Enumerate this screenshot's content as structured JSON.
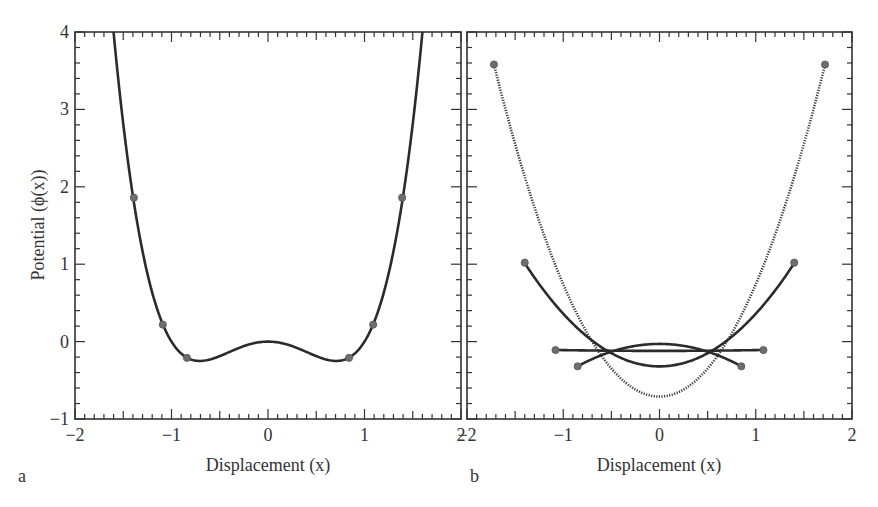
{
  "figure": {
    "panels": [
      {
        "id": "a",
        "label": "a"
      },
      {
        "id": "b",
        "label": "b"
      }
    ],
    "ylabel_text": "Potential (ϕ(x))",
    "xlabel_text": "Displacement (x)"
  },
  "chart_data": [
    {
      "type": "line",
      "panel": "a",
      "title": "",
      "xlabel": "Displacement (x)",
      "ylabel": "Potential (ϕ(x))",
      "xlim": [
        -2,
        2
      ],
      "ylim": [
        -1,
        4
      ],
      "xticks": [
        -2,
        -1,
        0,
        1,
        2
      ],
      "yticks": [
        -1,
        0,
        1,
        2,
        3,
        4
      ],
      "xtick_labels": [
        "−2",
        "−1",
        "0",
        "1",
        "2"
      ],
      "ytick_labels": [
        "−1",
        "0",
        "1",
        "2",
        "3",
        "4"
      ],
      "grid": false,
      "legend": null,
      "series": [
        {
          "name": "phi(x) = x^4 - x^2",
          "function": "x^4 - x^2",
          "x_range": [
            -1.6,
            1.6
          ],
          "style": "solid"
        }
      ],
      "markers": [
        {
          "x": -1.39,
          "y": 1.86
        },
        {
          "x": -1.09,
          "y": 0.22
        },
        {
          "x": -0.84,
          "y": -0.21
        },
        {
          "x": 0.84,
          "y": -0.21
        },
        {
          "x": 1.09,
          "y": 0.22
        },
        {
          "x": 1.39,
          "y": 1.86
        }
      ],
      "key_points": [
        {
          "x": -0.71,
          "y": -0.25,
          "note": "left minimum"
        },
        {
          "x": 0,
          "y": 0,
          "note": "local maximum"
        },
        {
          "x": 0.71,
          "y": -0.25,
          "note": "right minimum"
        }
      ]
    },
    {
      "type": "line",
      "panel": "b",
      "title": "",
      "xlabel": "Displacement (x)",
      "ylabel": "",
      "xlim": [
        -2,
        2
      ],
      "ylim": [
        -1,
        4
      ],
      "xticks": [
        -2,
        -1,
        0,
        1,
        2
      ],
      "xtick_labels": [
        "−2",
        "−1",
        "0",
        "1",
        "2"
      ],
      "grid": false,
      "legend": null,
      "series": [
        {
          "name": "quadratic through ±1.72",
          "a": 1.45,
          "c": -0.71,
          "x_range": [
            -1.72,
            1.72
          ],
          "endpoint_y": 3.58,
          "style": "dotted"
        },
        {
          "name": "quadratic through ±1.40",
          "a": 0.68,
          "c": -0.32,
          "x_range": [
            -1.4,
            1.4
          ],
          "endpoint_y": 1.02,
          "style": "solid"
        },
        {
          "name": "quadratic through ±1.08",
          "a": 0.01,
          "c": -0.12,
          "x_range": [
            -1.08,
            1.08
          ],
          "endpoint_y": -0.11,
          "style": "solid"
        },
        {
          "name": "quadratic through ±0.85",
          "a": -0.4,
          "c": -0.03,
          "x_range": [
            -0.85,
            0.85
          ],
          "endpoint_y": -0.32,
          "style": "solid"
        }
      ],
      "markers": [
        {
          "x": -1.72,
          "y": 3.58
        },
        {
          "x": 1.72,
          "y": 3.58
        },
        {
          "x": -1.4,
          "y": 1.02
        },
        {
          "x": 1.4,
          "y": 1.02
        },
        {
          "x": -1.08,
          "y": -0.11
        },
        {
          "x": 1.08,
          "y": -0.11
        },
        {
          "x": -0.85,
          "y": -0.32
        },
        {
          "x": 0.85,
          "y": -0.32
        }
      ]
    }
  ],
  "layout": {
    "panel_a": {
      "left": 75,
      "right": 461,
      "top": 32,
      "bottom": 419
    },
    "panel_b": {
      "left": 467,
      "right": 852,
      "top": 32,
      "bottom": 419
    },
    "colors": {
      "curve": "#2b2b2b",
      "marker": "#6d6d6d",
      "axis": "#333333"
    }
  }
}
